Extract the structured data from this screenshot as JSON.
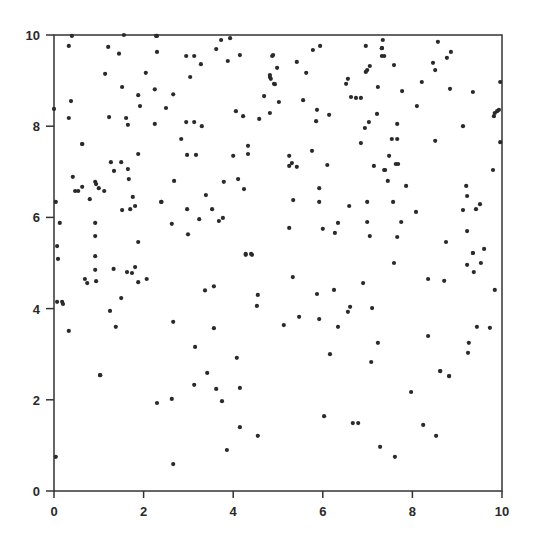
{
  "chart_data": {
    "type": "scatter",
    "title": "",
    "xlabel": "",
    "ylabel": "",
    "xlim": [
      0,
      10
    ],
    "ylim": [
      0,
      10
    ],
    "x_ticks": [
      "0",
      "2",
      "4",
      "6",
      "8",
      "10"
    ],
    "y_ticks": [
      "0",
      "2",
      "4",
      "6",
      "8",
      "10"
    ],
    "grid": false,
    "legend": null,
    "marker_color": "#2a2a2a",
    "axis_color": "#333333",
    "points": [
      [
        0.4,
        9.98
      ],
      [
        0.33,
        9.76
      ],
      [
        1.56,
        10.0
      ],
      [
        1.21,
        9.74
      ],
      [
        1.45,
        9.59
      ],
      [
        2.28,
        9.98
      ],
      [
        2.3,
        9.98
      ],
      [
        2.3,
        9.63
      ],
      [
        1.14,
        9.15
      ],
      [
        2.05,
        9.17
      ],
      [
        1.52,
        8.86
      ],
      [
        1.88,
        8.68
      ],
      [
        2.25,
        8.81
      ],
      [
        0.38,
        8.55
      ],
      [
        0.0,
        8.38
      ],
      [
        1.92,
        8.44
      ],
      [
        0.33,
        8.18
      ],
      [
        1.23,
        8.2
      ],
      [
        1.61,
        8.18
      ],
      [
        1.65,
        8.03
      ],
      [
        2.25,
        8.05
      ],
      [
        0.63,
        7.61
      ],
      [
        3.73,
        9.89
      ],
      [
        3.93,
        9.93
      ],
      [
        3.62,
        9.69
      ],
      [
        2.95,
        9.54
      ],
      [
        3.13,
        9.54
      ],
      [
        3.28,
        9.36
      ],
      [
        3.88,
        9.43
      ],
      [
        4.15,
        9.56
      ],
      [
        4.87,
        9.54
      ],
      [
        3.04,
        9.08
      ],
      [
        4.82,
        9.12
      ],
      [
        4.84,
        9.04
      ],
      [
        4.91,
        8.93
      ],
      [
        2.66,
        8.7
      ],
      [
        4.69,
        8.66
      ],
      [
        2.5,
        8.4
      ],
      [
        4.06,
        8.33
      ],
      [
        4.22,
        8.22
      ],
      [
        4.58,
        8.16
      ],
      [
        4.82,
        8.29
      ],
      [
        2.95,
        8.09
      ],
      [
        3.13,
        8.09
      ],
      [
        3.3,
        8.0
      ],
      [
        2.84,
        7.72
      ],
      [
        4.33,
        7.57
      ],
      [
        4.89,
        9.56
      ],
      [
        4.98,
        9.28
      ],
      [
        4.82,
        9.08
      ],
      [
        4.93,
        8.92
      ],
      [
        5.42,
        9.41
      ],
      [
        5.78,
        9.67
      ],
      [
        5.94,
        9.76
      ],
      [
        6.96,
        9.76
      ],
      [
        7.32,
        9.71
      ],
      [
        7.32,
        9.54
      ],
      [
        5.63,
        9.17
      ],
      [
        7.05,
        9.32
      ],
      [
        6.99,
        9.23
      ],
      [
        6.96,
        9.19
      ],
      [
        6.56,
        9.04
      ],
      [
        6.52,
        8.93
      ],
      [
        7.23,
        8.86
      ],
      [
        5.02,
        8.53
      ],
      [
        5.56,
        8.57
      ],
      [
        6.63,
        8.64
      ],
      [
        6.74,
        8.62
      ],
      [
        6.85,
        8.62
      ],
      [
        5.87,
        8.36
      ],
      [
        6.14,
        8.25
      ],
      [
        7.21,
        8.27
      ],
      [
        7.03,
        8.09
      ],
      [
        6.94,
        7.96
      ],
      [
        5.85,
        8.11
      ],
      [
        6.85,
        7.63
      ],
      [
        7.34,
        9.89
      ],
      [
        7.32,
        9.71
      ],
      [
        7.37,
        9.54
      ],
      [
        7.59,
        9.34
      ],
      [
        8.57,
        9.85
      ],
      [
        8.86,
        9.63
      ],
      [
        8.77,
        9.5
      ],
      [
        8.46,
        9.39
      ],
      [
        8.51,
        9.23
      ],
      [
        8.21,
        8.97
      ],
      [
        7.77,
        8.77
      ],
      [
        8.84,
        8.82
      ],
      [
        9.35,
        8.75
      ],
      [
        9.96,
        8.97
      ],
      [
        8.1,
        8.44
      ],
      [
        9.82,
        8.22
      ],
      [
        9.84,
        8.29
      ],
      [
        9.89,
        8.33
      ],
      [
        9.93,
        8.36
      ],
      [
        7.66,
        8.05
      ],
      [
        9.13,
        8.0
      ],
      [
        7.54,
        7.72
      ],
      [
        7.66,
        7.72
      ],
      [
        8.51,
        7.68
      ],
      [
        9.96,
        7.65
      ],
      [
        0.63,
        7.61
      ],
      [
        1.88,
        7.39
      ],
      [
        1.27,
        7.21
      ],
      [
        1.5,
        7.21
      ],
      [
        1.34,
        7.02
      ],
      [
        1.65,
        7.06
      ],
      [
        1.67,
        6.84
      ],
      [
        0.42,
        6.89
      ],
      [
        0.92,
        6.78
      ],
      [
        0.94,
        6.73
      ],
      [
        1.0,
        6.64
      ],
      [
        1.12,
        6.58
      ],
      [
        0.47,
        6.58
      ],
      [
        0.54,
        6.58
      ],
      [
        0.63,
        6.67
      ],
      [
        0.8,
        6.4
      ],
      [
        1.76,
        6.45
      ],
      [
        0.04,
        6.34
      ],
      [
        2.39,
        6.34
      ],
      [
        1.52,
        6.16
      ],
      [
        1.7,
        6.18
      ],
      [
        1.81,
        6.25
      ],
      [
        0.13,
        5.88
      ],
      [
        0.92,
        5.88
      ],
      [
        0.92,
        5.59
      ],
      [
        1.88,
        5.46
      ],
      [
        0.07,
        5.37
      ],
      [
        0.92,
        5.15
      ],
      [
        4.33,
        7.39
      ],
      [
        2.97,
        7.37
      ],
      [
        3.17,
        7.37
      ],
      [
        4.0,
        7.35
      ],
      [
        2.68,
        6.8
      ],
      [
        3.79,
        6.78
      ],
      [
        4.11,
        6.84
      ],
      [
        4.24,
        6.62
      ],
      [
        3.39,
        6.49
      ],
      [
        2.97,
        6.18
      ],
      [
        3.53,
        6.18
      ],
      [
        2.4,
        6.34
      ],
      [
        3.24,
        5.96
      ],
      [
        3.68,
        5.92
      ],
      [
        3.77,
        5.99
      ],
      [
        2.63,
        5.86
      ],
      [
        2.99,
        5.63
      ],
      [
        4.28,
        5.2
      ],
      [
        4.4,
        5.2
      ],
      [
        5.25,
        7.35
      ],
      [
        5.76,
        7.46
      ],
      [
        5.31,
        7.19
      ],
      [
        5.25,
        7.13
      ],
      [
        5.42,
        7.11
      ],
      [
        6.1,
        7.15
      ],
      [
        7.14,
        7.13
      ],
      [
        7.37,
        7.04
      ],
      [
        5.92,
        6.64
      ],
      [
        5.34,
        6.38
      ],
      [
        5.92,
        6.34
      ],
      [
        6.59,
        6.25
      ],
      [
        6.99,
        6.34
      ],
      [
        5.25,
        5.77
      ],
      [
        6.0,
        5.75
      ],
      [
        6.34,
        5.88
      ],
      [
        6.27,
        5.66
      ],
      [
        6.99,
        5.9
      ],
      [
        7.05,
        5.59
      ],
      [
        7.48,
        7.35
      ],
      [
        7.63,
        7.17
      ],
      [
        7.68,
        7.17
      ],
      [
        7.39,
        7.04
      ],
      [
        7.45,
        6.8
      ],
      [
        7.86,
        6.69
      ],
      [
        9.8,
        7.04
      ],
      [
        9.2,
        6.69
      ],
      [
        9.22,
        6.47
      ],
      [
        7.57,
        6.34
      ],
      [
        9.51,
        6.29
      ],
      [
        9.42,
        6.18
      ],
      [
        9.13,
        6.16
      ],
      [
        8.08,
        6.12
      ],
      [
        7.75,
        5.9
      ],
      [
        9.22,
        5.7
      ],
      [
        7.66,
        5.57
      ],
      [
        8.75,
        5.46
      ],
      [
        9.6,
        5.31
      ],
      [
        9.35,
        5.22
      ],
      [
        0.09,
        5.09
      ],
      [
        0.92,
        4.85
      ],
      [
        1.33,
        4.87
      ],
      [
        1.63,
        4.8
      ],
      [
        1.74,
        4.78
      ],
      [
        0.69,
        4.65
      ],
      [
        0.74,
        4.56
      ],
      [
        0.94,
        4.6
      ],
      [
        1.81,
        4.91
      ],
      [
        1.88,
        4.58
      ],
      [
        2.07,
        4.65
      ],
      [
        0.07,
        4.15
      ],
      [
        0.18,
        4.15
      ],
      [
        0.2,
        4.1
      ],
      [
        1.5,
        4.23
      ],
      [
        1.25,
        3.95
      ],
      [
        1.38,
        3.6
      ],
      [
        0.33,
        3.51
      ],
      [
        1.03,
        2.54
      ],
      [
        4.28,
        5.18
      ],
      [
        4.42,
        5.18
      ],
      [
        3.37,
        4.4
      ],
      [
        3.57,
        4.49
      ],
      [
        4.55,
        4.3
      ],
      [
        4.53,
        4.06
      ],
      [
        2.66,
        3.71
      ],
      [
        3.57,
        3.57
      ],
      [
        3.15,
        3.16
      ],
      [
        4.08,
        2.92
      ],
      [
        3.42,
        2.59
      ],
      [
        5.33,
        4.69
      ],
      [
        5.87,
        4.32
      ],
      [
        6.25,
        4.41
      ],
      [
        6.9,
        4.56
      ],
      [
        6.61,
        4.04
      ],
      [
        6.56,
        3.93
      ],
      [
        7.1,
        4.01
      ],
      [
        5.13,
        3.639
      ],
      [
        5.47,
        3.82
      ],
      [
        5.92,
        3.77
      ],
      [
        6.34,
        3.6
      ],
      [
        7.23,
        3.25
      ],
      [
        6.16,
        3.0
      ],
      [
        7.08,
        2.83
      ],
      [
        7.59,
        5.0
      ],
      [
        9.35,
        5.22
      ],
      [
        9.22,
        4.96
      ],
      [
        9.53,
        5.0
      ],
      [
        9.37,
        4.8
      ],
      [
        8.35,
        4.65
      ],
      [
        8.71,
        4.61
      ],
      [
        9.84,
        4.41
      ],
      [
        8.35,
        3.4
      ],
      [
        9.44,
        3.6
      ],
      [
        9.73,
        3.58
      ],
      [
        9.26,
        3.25
      ],
      [
        9.24,
        3.03
      ],
      [
        8.62,
        2.63
      ],
      [
        8.82,
        2.52
      ],
      [
        1.03,
        2.54
      ],
      [
        2.63,
        2.02
      ],
      [
        3.13,
        2.33
      ],
      [
        3.62,
        2.24
      ],
      [
        4.15,
        2.26
      ],
      [
        2.3,
        1.93
      ],
      [
        3.75,
        1.97
      ],
      [
        4.15,
        1.4
      ],
      [
        4.55,
        1.21
      ],
      [
        0.04,
        0.75
      ],
      [
        3.86,
        0.9
      ],
      [
        2.66,
        0.59
      ],
      [
        8.62,
        2.63
      ],
      [
        8.82,
        2.52
      ],
      [
        7.97,
        2.17
      ],
      [
        6.03,
        1.64
      ],
      [
        6.67,
        1.49
      ],
      [
        6.79,
        1.49
      ],
      [
        8.24,
        1.45
      ],
      [
        8.53,
        1.21
      ],
      [
        7.28,
        0.97
      ],
      [
        7.61,
        0.75
      ]
    ]
  }
}
